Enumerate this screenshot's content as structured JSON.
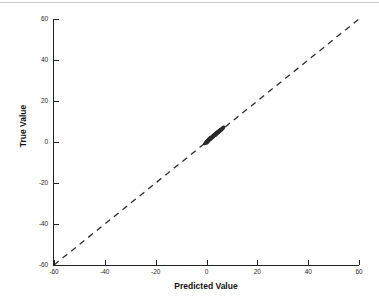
{
  "chart_data": {
    "type": "scatter",
    "title": "",
    "xlabel": "Predicted Value",
    "ylabel": "True Value",
    "xlim": [
      -60,
      60
    ],
    "ylim": [
      -60,
      60
    ],
    "xticks": [
      -60,
      -40,
      -20,
      0,
      20,
      40,
      60
    ],
    "yticks": [
      -60,
      -40,
      -20,
      0,
      20,
      40,
      60
    ],
    "xticklabels": [
      "-60",
      "-40",
      "-20",
      "0",
      "20",
      "40",
      "60"
    ],
    "yticklabels": [
      "-60",
      "-40",
      "-20",
      "0",
      "20",
      "40",
      "60"
    ],
    "grid": false,
    "legend": null,
    "series": [
      {
        "name": "predictions",
        "marker": "dot",
        "color": "#2b2b2b",
        "points": [
          [
            -0.6,
            -0.8
          ],
          [
            -0.4,
            -0.5
          ],
          [
            -0.3,
            -0.2
          ],
          [
            -0.2,
            0.0
          ],
          [
            -0.1,
            0.1
          ],
          [
            0.0,
            -0.3
          ],
          [
            0.0,
            0.2
          ],
          [
            0.1,
            0.0
          ],
          [
            0.1,
            0.4
          ],
          [
            0.2,
            0.1
          ],
          [
            0.2,
            0.5
          ],
          [
            0.3,
            0.2
          ],
          [
            0.3,
            0.6
          ],
          [
            0.4,
            0.3
          ],
          [
            0.4,
            0.8
          ],
          [
            0.5,
            0.4
          ],
          [
            0.5,
            0.9
          ],
          [
            0.6,
            0.5
          ],
          [
            0.6,
            1.0
          ],
          [
            0.7,
            0.6
          ],
          [
            0.7,
            1.1
          ],
          [
            0.8,
            0.8
          ],
          [
            0.8,
            1.2
          ],
          [
            0.9,
            0.9
          ],
          [
            0.9,
            1.3
          ],
          [
            1.0,
            1.0
          ],
          [
            1.0,
            1.4
          ],
          [
            1.1,
            1.1
          ],
          [
            1.1,
            1.5
          ],
          [
            1.2,
            1.2
          ],
          [
            1.2,
            1.6
          ],
          [
            1.3,
            1.3
          ],
          [
            1.3,
            1.7
          ],
          [
            1.4,
            1.4
          ],
          [
            1.4,
            1.8
          ],
          [
            1.5,
            1.5
          ],
          [
            1.5,
            2.0
          ],
          [
            1.6,
            1.6
          ],
          [
            1.6,
            2.1
          ],
          [
            1.7,
            1.7
          ],
          [
            1.7,
            2.2
          ],
          [
            1.8,
            1.9
          ],
          [
            1.8,
            2.3
          ],
          [
            1.9,
            2.0
          ],
          [
            1.9,
            2.4
          ],
          [
            2.0,
            2.1
          ],
          [
            2.0,
            2.5
          ],
          [
            2.1,
            2.2
          ],
          [
            2.1,
            2.6
          ],
          [
            2.2,
            2.3
          ],
          [
            2.2,
            2.7
          ],
          [
            2.3,
            2.4
          ],
          [
            2.3,
            2.8
          ],
          [
            2.4,
            2.5
          ],
          [
            2.4,
            2.9
          ],
          [
            2.5,
            2.6
          ],
          [
            2.5,
            3.0
          ],
          [
            2.6,
            2.7
          ],
          [
            2.6,
            3.1
          ],
          [
            2.7,
            2.8
          ],
          [
            2.7,
            3.2
          ],
          [
            2.8,
            3.0
          ],
          [
            2.8,
            3.4
          ],
          [
            2.9,
            3.1
          ],
          [
            2.9,
            3.5
          ],
          [
            3.0,
            3.2
          ],
          [
            3.0,
            3.6
          ],
          [
            3.1,
            3.3
          ],
          [
            3.1,
            3.7
          ],
          [
            3.2,
            3.4
          ],
          [
            3.2,
            3.8
          ],
          [
            3.3,
            3.5
          ],
          [
            3.3,
            3.9
          ],
          [
            3.4,
            3.6
          ],
          [
            3.4,
            4.0
          ],
          [
            3.5,
            3.7
          ],
          [
            3.5,
            4.1
          ],
          [
            3.6,
            3.8
          ],
          [
            3.6,
            4.2
          ],
          [
            3.7,
            4.0
          ],
          [
            3.7,
            4.3
          ],
          [
            3.8,
            4.1
          ],
          [
            3.8,
            4.4
          ],
          [
            3.9,
            4.2
          ],
          [
            3.9,
            4.5
          ],
          [
            4.0,
            4.3
          ],
          [
            4.0,
            4.6
          ],
          [
            4.1,
            4.4
          ],
          [
            4.1,
            4.7
          ],
          [
            4.2,
            4.5
          ],
          [
            4.2,
            4.8
          ],
          [
            4.3,
            4.6
          ],
          [
            4.3,
            4.9
          ],
          [
            4.4,
            4.7
          ],
          [
            4.4,
            5.0
          ],
          [
            4.5,
            4.8
          ],
          [
            4.5,
            5.1
          ],
          [
            4.6,
            5.0
          ],
          [
            4.6,
            5.2
          ],
          [
            4.7,
            5.1
          ],
          [
            4.7,
            5.3
          ],
          [
            4.8,
            5.2
          ],
          [
            4.8,
            5.4
          ],
          [
            4.9,
            5.3
          ],
          [
            4.9,
            5.5
          ],
          [
            5.0,
            5.4
          ],
          [
            5.0,
            5.6
          ],
          [
            5.1,
            5.5
          ],
          [
            5.1,
            5.7
          ],
          [
            5.2,
            5.6
          ],
          [
            5.2,
            5.8
          ],
          [
            5.3,
            5.7
          ],
          [
            5.3,
            5.9
          ],
          [
            5.4,
            5.8
          ],
          [
            5.4,
            6.0
          ],
          [
            5.5,
            5.9
          ],
          [
            5.5,
            6.1
          ],
          [
            5.6,
            6.0
          ],
          [
            5.6,
            6.2
          ],
          [
            5.7,
            6.1
          ],
          [
            5.8,
            6.3
          ],
          [
            5.9,
            6.4
          ],
          [
            6.0,
            6.5
          ],
          [
            6.1,
            6.6
          ],
          [
            6.2,
            6.7
          ],
          [
            6.3,
            6.8
          ],
          [
            6.4,
            6.9
          ],
          [
            6.5,
            7.0
          ],
          [
            6.6,
            7.1
          ],
          [
            6.7,
            7.2
          ],
          [
            0.3,
            -0.4
          ],
          [
            0.5,
            -0.1
          ],
          [
            0.8,
            0.3
          ],
          [
            1.1,
            0.7
          ],
          [
            1.4,
            1.0
          ],
          [
            1.7,
            1.3
          ],
          [
            2.0,
            1.7
          ],
          [
            2.3,
            2.0
          ],
          [
            2.6,
            2.3
          ],
          [
            2.9,
            2.6
          ],
          [
            3.2,
            3.0
          ],
          [
            3.5,
            3.3
          ],
          [
            3.8,
            3.6
          ],
          [
            4.1,
            3.9
          ],
          [
            4.4,
            4.3
          ],
          [
            4.7,
            4.6
          ],
          [
            5.0,
            4.9
          ],
          [
            5.3,
            5.2
          ],
          [
            5.6,
            5.5
          ],
          [
            5.9,
            5.9
          ],
          [
            -0.8,
            -1.0
          ],
          [
            -0.5,
            -0.7
          ],
          [
            0.1,
            -0.6
          ],
          [
            0.4,
            0.9
          ],
          [
            0.9,
            1.6
          ],
          [
            1.3,
            2.1
          ],
          [
            1.8,
            1.5
          ],
          [
            2.2,
            1.9
          ],
          [
            2.7,
            2.4
          ],
          [
            3.1,
            2.9
          ],
          [
            3.6,
            3.2
          ],
          [
            4.0,
            3.7
          ],
          [
            4.5,
            4.2
          ],
          [
            4.9,
            4.7
          ],
          [
            5.4,
            5.1
          ],
          [
            5.8,
            5.6
          ],
          [
            6.1,
            6.0
          ],
          [
            6.4,
            6.3
          ],
          [
            6.6,
            6.6
          ],
          [
            6.8,
            7.3
          ]
        ]
      }
    ],
    "reference_line": {
      "name": "identity-line",
      "style": "dashed",
      "color": "#2b2b2b",
      "from": [
        -60,
        -60
      ],
      "to": [
        60,
        60
      ]
    }
  }
}
